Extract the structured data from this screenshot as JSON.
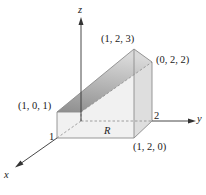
{
  "diagram": {
    "type": "3d-solid-over-region",
    "axes": {
      "x": "x",
      "y": "y",
      "z": "z"
    },
    "region_label": "R",
    "tick_labels": {
      "x_tick": "1",
      "y_tick": "2"
    },
    "points": [
      {
        "id": "p101",
        "label": "(1, 0, 1)"
      },
      {
        "id": "p123",
        "label": "(1, 2, 3)"
      },
      {
        "id": "p022",
        "label": "(0, 2, 2)"
      },
      {
        "id": "p120",
        "label": "(1, 2, 0)"
      }
    ],
    "colors": {
      "top_face": "#9a9a9a",
      "top_face_light": "#d4d4d4",
      "side_face": "#ececec",
      "end_face": "#dcdcdc",
      "edge": "#8c8c8c",
      "axis": "#333333"
    }
  }
}
